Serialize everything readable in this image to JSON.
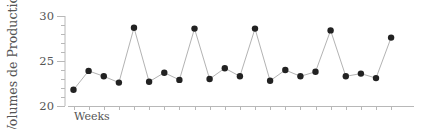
{
  "chart_data": {
    "type": "line",
    "title": "",
    "xlabel": "Weeks",
    "ylabel": "Volumes de Production",
    "ylim": [
      20,
      30
    ],
    "yticks": [
      20,
      25,
      30
    ],
    "ytick_labels": [
      "20",
      "25",
      "30"
    ],
    "y_minor_step": 1,
    "grid": false,
    "legend": null,
    "x": [
      1,
      2,
      3,
      4,
      5,
      6,
      7,
      8,
      9,
      10,
      11,
      12,
      13,
      14,
      15,
      16,
      17,
      18,
      19,
      20,
      21,
      22
    ],
    "series": [
      {
        "name": "Volumes de Production",
        "values": [
          21.8,
          23.9,
          23.3,
          22.6,
          28.7,
          22.7,
          23.7,
          22.9,
          28.6,
          23.0,
          24.2,
          23.3,
          28.6,
          22.8,
          24.0,
          23.3,
          23.8,
          28.4,
          23.3,
          23.6,
          23.1,
          27.6
        ],
        "line_color": "#b3b3b3",
        "marker_color": "#222222"
      }
    ]
  },
  "axis": {
    "ylabel": "Volumes de Production",
    "xlabel": "Weeks",
    "ytick_labels": [
      "20",
      "25",
      "30"
    ]
  }
}
